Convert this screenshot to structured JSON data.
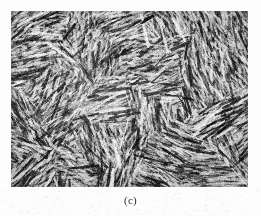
{
  "page": {
    "background_color": "#fdfdfd",
    "width": 261,
    "height": 216
  },
  "figure": {
    "caption": "(c)",
    "kind": "micrograph",
    "plate": {
      "x": 11,
      "y": 11,
      "width": 237,
      "height": 176,
      "border": "none",
      "mean_gray": "#8f8f8f",
      "dark_tone": "#1d1d1d",
      "mid_tone": "#7b7b7b",
      "light_tone": "#e6e6e6"
    }
  },
  "chart_data": {
    "type": "heatmap",
    "title": "(c)",
    "xlabel": "",
    "ylabel": "",
    "note": "Textured grayscale micrograph; no numeric axes, ticks, legend or scale bar are rendered in the image.",
    "grayscale_range": [
      10,
      240
    ],
    "grid": false,
    "legend": null
  }
}
